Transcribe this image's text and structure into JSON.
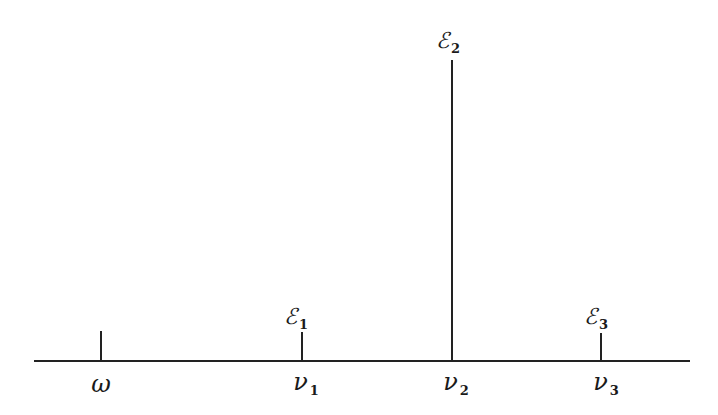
{
  "figure": {
    "type": "spectrum-stem-diagram",
    "axis": {
      "x_start": 34,
      "x_end": 690,
      "y": 361
    },
    "stems": [
      {
        "id": "omega",
        "x": 101,
        "top": 331,
        "label_symbol": "ω",
        "label_sub": "",
        "peak_symbol": "",
        "peak_sub": ""
      },
      {
        "id": "nu1",
        "x": 302,
        "top": 332,
        "label_symbol": "ν",
        "label_sub": "1",
        "peak_symbol": "ℰ",
        "peak_sub": "1"
      },
      {
        "id": "nu2",
        "x": 452,
        "top": 60,
        "label_symbol": "ν",
        "label_sub": "2",
        "peak_symbol": "ℰ",
        "peak_sub": "2"
      },
      {
        "id": "nu3",
        "x": 601,
        "top": 333,
        "label_symbol": "ν",
        "label_sub": "3",
        "peak_symbol": "ℰ",
        "peak_sub": "3"
      }
    ],
    "line_color": "#222222"
  }
}
